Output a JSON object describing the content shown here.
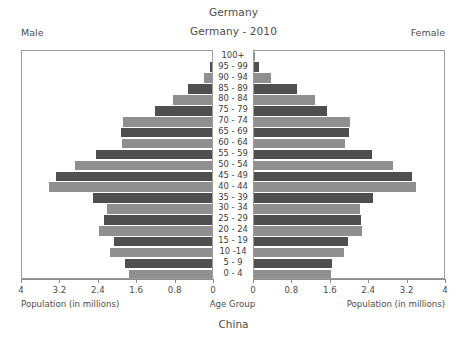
{
  "titles": {
    "top": "Germany",
    "subtitle": "Germany - 2010",
    "footer": "China"
  },
  "labels": {
    "male": "Male",
    "female": "Female",
    "axis_caption_left": "Population (in millions)",
    "axis_caption_right": "Population (in millions)",
    "axis_caption_center": "Age Group"
  },
  "colors": {
    "bar_dark": "#4f4f4f",
    "bar_light": "#8f8f8f",
    "frame": "#9b9b9b",
    "text": "#4d4d4d",
    "background": "#ffffff"
  },
  "axis": {
    "ticks_left": [
      "4",
      "3.2",
      "2.4",
      "1.6",
      "0.8",
      "0"
    ],
    "ticks_right": [
      "0",
      "0.8",
      "1.6",
      "2.4",
      "3.2",
      "4"
    ],
    "max": 4,
    "tick_step": 0.8
  },
  "chart_data": {
    "type": "bar",
    "subtype": "population-pyramid",
    "title": "Germany",
    "subtitle": "Germany - 2010",
    "footer": "China",
    "xlabel": "Population (in millions)",
    "ylabel": "Age Group",
    "xlim": [
      0,
      4
    ],
    "grid": false,
    "legend": [
      "Male",
      "Female"
    ],
    "legend_position": "top-outside",
    "orientation": "horizontal-mirrored",
    "categories": [
      "100+",
      "95 - 99",
      "90 - 94",
      "85 - 89",
      "80 - 84",
      "75 - 79",
      "70 - 74",
      "65 - 69",
      "60 - 64",
      "55 - 59",
      "50 - 54",
      "45 - 49",
      "40 - 44",
      "35 - 39",
      "30 - 34",
      "25 - 29",
      "20 - 24",
      "15 - 19",
      "10 -14",
      "5 - 9",
      "0 - 4"
    ],
    "series": [
      {
        "name": "Male",
        "side": "left",
        "values": [
          0.01,
          0.05,
          0.16,
          0.5,
          0.82,
          1.18,
          1.85,
          1.9,
          1.88,
          2.42,
          2.85,
          3.25,
          3.4,
          2.48,
          2.18,
          2.25,
          2.35,
          2.05,
          2.12,
          1.82,
          1.72
        ]
      },
      {
        "name": "Female",
        "side": "right",
        "values": [
          0.02,
          0.11,
          0.35,
          0.9,
          1.28,
          1.52,
          2.0,
          1.98,
          1.9,
          2.45,
          2.9,
          3.3,
          3.38,
          2.48,
          2.2,
          2.22,
          2.25,
          1.95,
          1.88,
          1.62,
          1.6
        ]
      }
    ]
  }
}
